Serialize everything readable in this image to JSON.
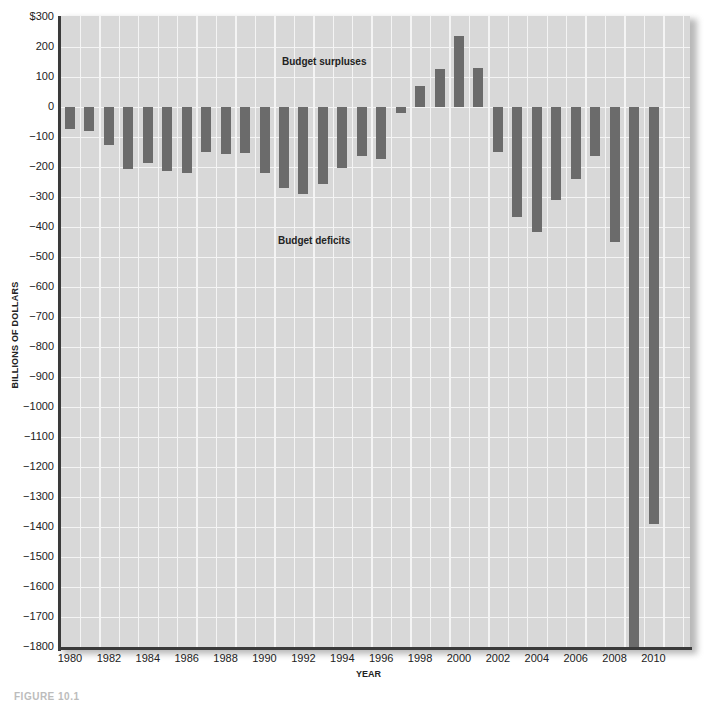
{
  "chart_data": {
    "type": "bar",
    "title": "",
    "xlabel": "YEAR",
    "ylabel": "BILLIONS OF DOLLARS",
    "ylim": [
      -1800,
      300
    ],
    "yticks": [
      300,
      200,
      100,
      0,
      -100,
      -200,
      -300,
      -400,
      -500,
      -600,
      -700,
      -800,
      -900,
      -1000,
      -1100,
      -1200,
      -1300,
      -1400,
      -1500,
      -1600,
      -1700,
      -1800
    ],
    "ytick_labels": [
      "$300",
      "200",
      "100",
      "0",
      "-100",
      "-200",
      "-300",
      "-400",
      "-500",
      "-600",
      "-700",
      "-800",
      "-900",
      "-1000",
      "-1100",
      "-1200",
      "-1300",
      "-1400",
      "-1500",
      "-1600",
      "-1700",
      "-1800"
    ],
    "xtick_labels": [
      "1980",
      "1982",
      "1984",
      "1986",
      "1988",
      "1990",
      "1992",
      "1994",
      "1996",
      "1998",
      "2000",
      "2002",
      "2004",
      "2006",
      "2008",
      "2010"
    ],
    "grid": true,
    "legend": null,
    "annotations": [
      {
        "text": "Budget surpluses",
        "x": 1990,
        "y": 150
      },
      {
        "text": "Budget deficits",
        "x": 1990,
        "y": -400
      }
    ],
    "categories": [
      "1980",
      "1981",
      "1982",
      "1983",
      "1984",
      "1985",
      "1986",
      "1987",
      "1988",
      "1989",
      "1990",
      "1991",
      "1992",
      "1993",
      "1994",
      "1995",
      "1996",
      "1997",
      "1998",
      "1999",
      "2000",
      "2001",
      "2002",
      "2003",
      "2004",
      "2005",
      "2006",
      "2007",
      "2008",
      "2009",
      "2010"
    ],
    "values": [
      -74,
      -79,
      -128,
      -208,
      -185,
      -212,
      -221,
      -150,
      -155,
      -152,
      -221,
      -269,
      -290,
      -255,
      -203,
      -164,
      -174,
      -20,
      71,
      126,
      237,
      129,
      -150,
      -367,
      -416,
      -310,
      -239,
      -163,
      -450,
      -1800,
      -1390
    ],
    "series_color": "#6b6b6b",
    "background_color": "#d8d8d8"
  },
  "caption": "FIGURE 10.1"
}
